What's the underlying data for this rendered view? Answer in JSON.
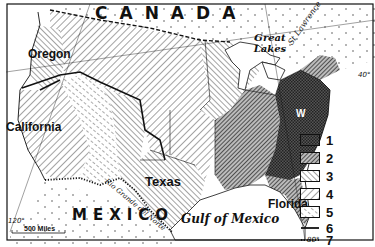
{
  "map": {
    "country_labels": {
      "canada": "CANADA",
      "mexico": "MEXICO"
    },
    "region_labels": {
      "oregon": "Oregon",
      "california": "California",
      "texas": "Texas",
      "florida": "Florida",
      "washington_marker": "W"
    },
    "water_labels": {
      "great_lakes": "Great Lakes",
      "gulf_of_mexico": "Gulf of Mexico",
      "st_lawrence": "St Lawrence",
      "rio_grande": "Rio Grande del Norte"
    },
    "coordinate_labels": {
      "lat_40": "40°",
      "lon_120": "120°",
      "lon_80": "80°"
    },
    "scale_bar": {
      "label": "500 Miles"
    },
    "legend": {
      "items": [
        {
          "key": "1",
          "pattern": "crosshatch-dark"
        },
        {
          "key": "2",
          "pattern": "dense-diagonal-right"
        },
        {
          "key": "3",
          "pattern": "diagonal-left"
        },
        {
          "key": "4",
          "pattern": "wide-diagonal-right"
        },
        {
          "key": "5",
          "pattern": "broken-diagonal-left"
        },
        {
          "key": "6",
          "pattern": "solid-line"
        },
        {
          "key": "7",
          "pattern": "dotted-line"
        }
      ]
    },
    "colors": {
      "ink": "#111111",
      "paper": "#ffffff",
      "dark_fill": "#444444"
    }
  }
}
